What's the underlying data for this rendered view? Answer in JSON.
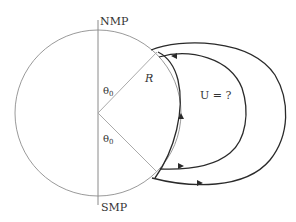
{
  "diagram": {
    "labels": {
      "north_pole": "NMP",
      "south_pole": "SMP",
      "radius": "R",
      "theta_upper": "θ",
      "theta_upper_sub": "0",
      "theta_lower": "θ",
      "theta_lower_sub": "0",
      "unknown": "U = ?"
    },
    "colors": {
      "circle": "#9a9a9a",
      "axis": "#8a8a8a",
      "field_lines": "#2a2a2a",
      "text": "#333333",
      "background": "#ffffff"
    }
  }
}
